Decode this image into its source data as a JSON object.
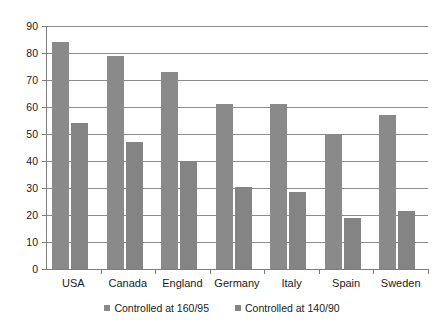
{
  "chart_data": {
    "type": "bar",
    "title": "",
    "subtitle": "",
    "xlabel": "",
    "ylabel": "",
    "ylim": [
      0,
      90
    ],
    "ytick_step": 10,
    "yticks": [
      0,
      10,
      20,
      30,
      40,
      50,
      60,
      70,
      80,
      90
    ],
    "grid": true,
    "grid_axis": "y",
    "legend_position": "bottom",
    "categories": [
      "USA",
      "Canada",
      "England",
      "Germany",
      "Italy",
      "Spain",
      "Sweden"
    ],
    "series": [
      {
        "name": "Controlled at 160/95",
        "color": "#8a8a8a",
        "values": [
          84,
          79,
          73,
          61,
          61,
          50,
          57
        ]
      },
      {
        "name": "Controlled at 140/90",
        "color": "#848484",
        "values": [
          54,
          47,
          40,
          30.5,
          28.5,
          19,
          21.5
        ]
      }
    ]
  },
  "colors": {
    "series_1": "#8a8a8a",
    "series_2": "#848484",
    "gridline": "#8c8c8c",
    "axis": "#7d7d7d",
    "text": "#1a1a1a",
    "background": "#ffffff"
  }
}
